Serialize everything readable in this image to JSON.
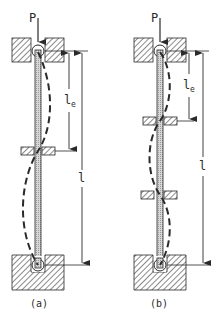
{
  "diagram": {
    "figures": [
      {
        "id": "a",
        "caption": "(a)",
        "load_label": "P",
        "effective_length_label": "l",
        "effective_length_subscript": "e",
        "total_length_label": "l",
        "intermediate_restraints": 1
      },
      {
        "id": "b",
        "caption": "(b)",
        "load_label": "P",
        "effective_length_label": "l",
        "effective_length_subscript": "e",
        "total_length_label": "l",
        "intermediate_restraints": 2
      }
    ]
  }
}
